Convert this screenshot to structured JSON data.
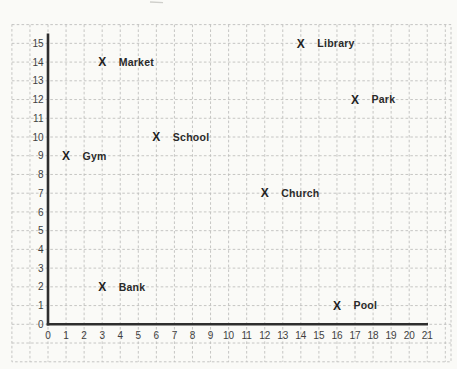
{
  "page": {
    "background": "#fafaf7"
  },
  "chart_data": {
    "type": "scatter",
    "title": "",
    "xlabel": "",
    "ylabel": "",
    "marker_glyph": "X",
    "grid": true,
    "xlim": [
      0,
      21
    ],
    "ylim": [
      0,
      15
    ],
    "x_ticks": [
      "0",
      "1",
      "2",
      "3",
      "4",
      "5",
      "6",
      "7",
      "8",
      "9",
      "10",
      "11",
      "12",
      "13",
      "14",
      "15",
      "16",
      "17",
      "18",
      "19",
      "20",
      "21"
    ],
    "y_ticks": [
      "0",
      "1",
      "2",
      "3",
      "4",
      "5",
      "6",
      "7",
      "8",
      "9",
      "10",
      "11",
      "12",
      "13",
      "14",
      "15"
    ],
    "points": [
      {
        "label": "Library",
        "x": 14,
        "y": 15
      },
      {
        "label": "Market",
        "x": 3,
        "y": 14
      },
      {
        "label": "Park",
        "x": 17,
        "y": 12
      },
      {
        "label": "School",
        "x": 6,
        "y": 10
      },
      {
        "label": "Gym",
        "x": 1,
        "y": 9
      },
      {
        "label": "Church",
        "x": 12,
        "y": 7
      },
      {
        "label": "Bank",
        "x": 3,
        "y": 2
      },
      {
        "label": "Pool",
        "x": 16,
        "y": 1
      }
    ],
    "colors": {
      "grid_line": "#c0c0bd",
      "axis_line": "#2e2e2e",
      "tick_text": "#3f3f3f",
      "point_text": "#2a2a2a",
      "paper": "#fafaf7"
    }
  }
}
